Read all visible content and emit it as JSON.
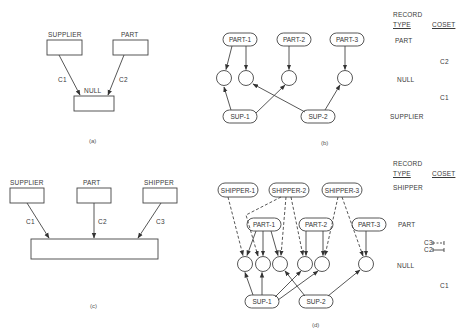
{
  "panel_a": {
    "caption": "(a)",
    "boxes": {
      "supplier": "SUPPLIER",
      "part": "PART",
      "null": "NULL"
    },
    "sets": {
      "c1": "C1",
      "c2": "C2"
    }
  },
  "panel_b": {
    "caption": "(b)",
    "parts": [
      "PART-1",
      "PART-2",
      "PART-3"
    ],
    "sups": [
      "SUP-1",
      "SUP-2"
    ],
    "legend": {
      "record_header": "RECORD",
      "type_header": "TYPE",
      "coset_header": "COSET",
      "rows": [
        "PART",
        "C2",
        "NULL",
        "C1",
        "SUPPLIER"
      ]
    }
  },
  "panel_c": {
    "caption": "(c)",
    "boxes": {
      "supplier": "SUPPLIER",
      "part": "PART",
      "shipper": "SHIPPER"
    },
    "sets": {
      "c1": "C1",
      "c2": "C2",
      "c3": "C3"
    }
  },
  "panel_d": {
    "caption": "(d)",
    "shippers": [
      "SHIPPER-1",
      "SHIPPER-2",
      "SHIPPER-3"
    ],
    "parts": [
      "PART-1",
      "PART-2",
      "PART-3"
    ],
    "sups": [
      "SUP-1",
      "SUP-2"
    ],
    "legend": {
      "record_header": "RECORD",
      "type_header": "TYPE",
      "coset_header": "COSET",
      "shipper": "SHIPPER",
      "part": "PART",
      "c3": "C3",
      "c2": "C2",
      "null": "NULL",
      "c1": "C1"
    }
  }
}
